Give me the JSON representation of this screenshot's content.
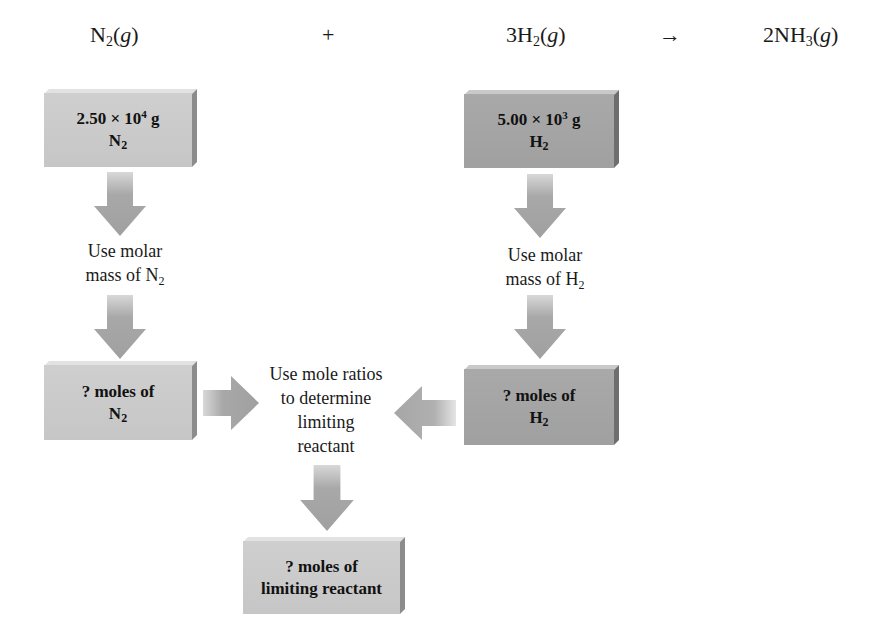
{
  "equation": {
    "reactant1": {
      "coef": "",
      "symbol": "N",
      "sub": "2",
      "state": "g"
    },
    "plus": "+",
    "reactant2": {
      "coef": "3",
      "symbol": "H",
      "sub": "2",
      "state": "g"
    },
    "arrow": "→",
    "product": {
      "coef": "2",
      "symbol": "NH",
      "sub": "3",
      "state": "g"
    }
  },
  "boxes": {
    "n2_mass": {
      "value": "2.50 × 10",
      "exp": "4",
      "unit": " g",
      "species": "N",
      "species_sub": "2"
    },
    "h2_mass": {
      "value": "5.00 × 10",
      "exp": "3",
      "unit": " g",
      "species": "H",
      "species_sub": "2"
    },
    "n2_moles": {
      "line1": "? moles of",
      "species": "N",
      "species_sub": "2"
    },
    "h2_moles": {
      "line1": "? moles of",
      "species": "H",
      "species_sub": "2"
    },
    "limiting_moles": {
      "line1": "? moles of",
      "line2": "limiting reactant"
    }
  },
  "steps": {
    "n2_molar": {
      "line1": "Use molar",
      "line2": "mass of N",
      "sub": "2"
    },
    "h2_molar": {
      "line1": "Use molar",
      "line2": "mass of H",
      "sub": "2"
    },
    "mole_ratio": {
      "line1": "Use mole ratios",
      "line2": "to determine",
      "line3": "limiting",
      "line4": "reactant"
    }
  },
  "colors": {
    "light_box": "#c9c9c9",
    "dark_box": "#a3a3a3",
    "arrow": "#a6a6a6"
  }
}
